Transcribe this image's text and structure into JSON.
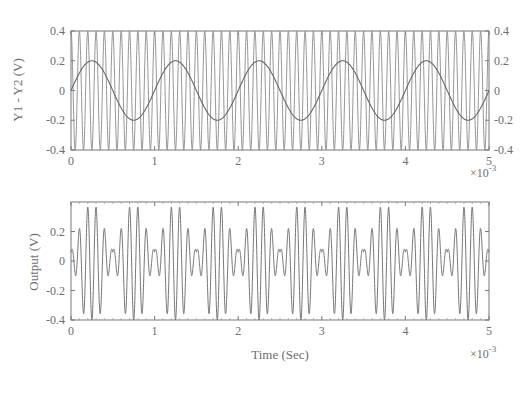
{
  "chart_data": [
    {
      "type": "line",
      "title": "",
      "xlabel": "",
      "ylabel": "Y1 - Y2 (V)",
      "x_multiplier": "×10^-3",
      "xlim": [
        0,
        5
      ],
      "ylim": [
        -0.4,
        0.4
      ],
      "xticks": [
        "0",
        "1",
        "2",
        "3",
        "4",
        "5"
      ],
      "yticks_left": [
        "0.4",
        "0.2",
        "0",
        "-0.2",
        "-0.4"
      ],
      "yticks_right": [
        "0.4",
        "0.2",
        "0",
        "-0.2",
        "-0.4"
      ],
      "grid": false,
      "series": [
        {
          "name": "Y1 (carrier)",
          "description": "high-frequency sinusoid ~10 cycles per 1e-3 s",
          "amplitude": 0.4,
          "frequency_hz": 10000
        },
        {
          "name": "Y2 (modulating)",
          "description": "low-frequency sinusoid, 5 periods over 5e-3 s",
          "amplitude": 0.2,
          "frequency_hz": 1000,
          "x": [
            0,
            0.25,
            0.5,
            0.75,
            1.0,
            1.25,
            1.5,
            1.75,
            2.0,
            2.25,
            2.5,
            2.75,
            3.0,
            3.25,
            3.5,
            3.75,
            4.0,
            4.25,
            4.5,
            4.75,
            5.0
          ],
          "values": [
            0,
            0.2,
            0,
            -0.2,
            0,
            0.2,
            0,
            -0.2,
            0,
            0.2,
            0,
            -0.2,
            0,
            0.2,
            0,
            -0.2,
            0,
            0.2,
            0,
            -0.2,
            0
          ]
        }
      ]
    },
    {
      "type": "line",
      "title": "",
      "xlabel": "Time (Sec)",
      "ylabel": "Output (V)",
      "x_multiplier": "×10^-3",
      "xlim": [
        0,
        5
      ],
      "ylim": [
        -0.4,
        0.4
      ],
      "xticks": [
        "0",
        "1",
        "2",
        "3",
        "4",
        "5"
      ],
      "yticks": [
        "0.2",
        "0",
        "-0.2",
        "-0.4"
      ],
      "grid": false,
      "series": [
        {
          "name": "Output",
          "description": "modulated waveform, envelope repeats every 0.5e-3 s, peaks ≈ ±0.4 near 0.25e-3 s, small 'M' ripple ≈ 0.05–0.1 near 0, 0.5e-3, 1e-3 ...",
          "envelope_peak": 0.4,
          "carrier_frequency_hz": 10000,
          "envelope_period_s": 0.0005
        }
      ]
    }
  ]
}
